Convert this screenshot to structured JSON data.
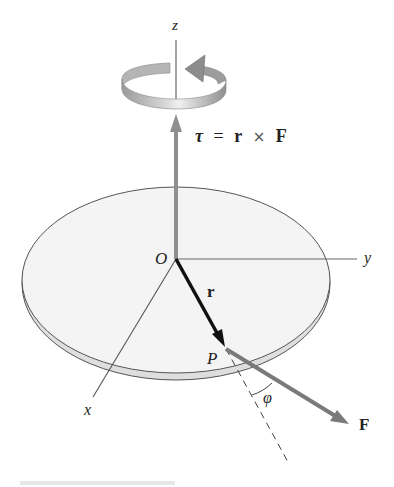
{
  "labels": {
    "z_axis": "z",
    "y_axis": "y",
    "x_axis": "x",
    "origin": "O",
    "position_vector": "r",
    "point": "P",
    "angle": "φ",
    "force": "F",
    "equation": {
      "tau": "τ",
      "eq": "=",
      "r": "r",
      "cross": "×",
      "F": "F"
    }
  },
  "colors": {
    "disk_fill": "#f4f4f4",
    "disk_edge": "#d9d9d9",
    "outline": "#555555",
    "torque_arrow": "#8a8a8a",
    "force_arrow": "#7a7a7a",
    "position_arrow": "#111111",
    "rotation_ribbon": "#a8a8a8"
  }
}
